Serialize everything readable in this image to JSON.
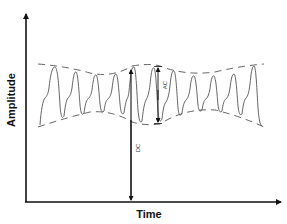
{
  "diagram": {
    "title": "",
    "type": "PPG-style waveform with AC and DC components",
    "axes": {
      "y_label": "Amplitude",
      "x_label": "Time"
    },
    "annotations": {
      "dc_label": "DC",
      "ac_label": "AC"
    },
    "colors": {
      "axis": "#111111",
      "waveform": "#555555",
      "envelope": "#555555",
      "background": "#ffffff"
    },
    "waveform": {
      "cycles": 12,
      "description": "Periodic pulses with a sharp systolic peak and a smaller dicrotic shoulder, bounded by dashed upper and lower envelopes that undulate slowly."
    }
  }
}
